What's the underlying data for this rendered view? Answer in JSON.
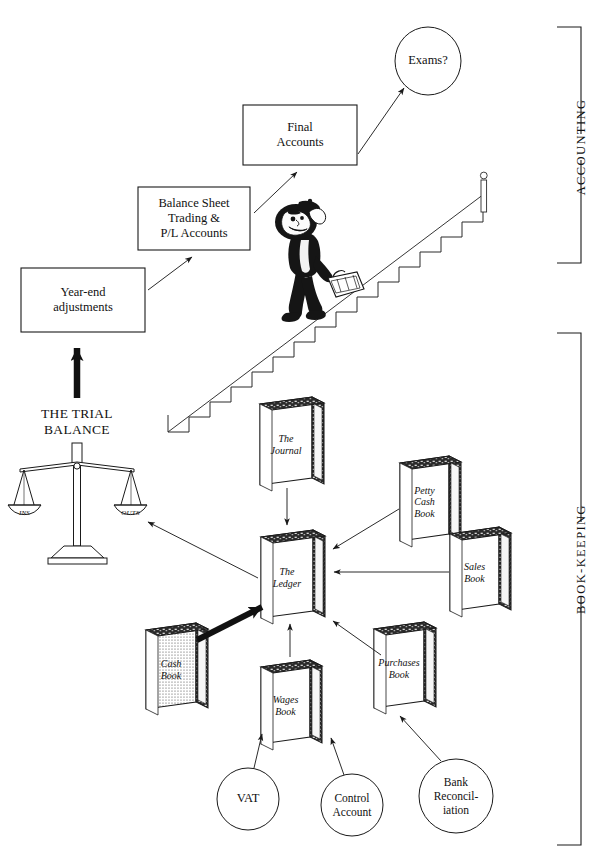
{
  "diagram": {
    "background": "#ffffff",
    "ink": "#1a1a1a"
  },
  "side_brackets": [
    {
      "id": "accounting",
      "label": "ACCOUNTING",
      "top": 27,
      "bottom": 263
    },
    {
      "id": "book-keeping",
      "label": "BOOK-KEEPING",
      "top": 333,
      "bottom": 845
    }
  ],
  "boxes": [
    {
      "id": "final-accounts",
      "label": "Final\nAccounts",
      "x": 243,
      "y": 105,
      "w": 114,
      "h": 60
    },
    {
      "id": "balance-sheet",
      "label": "Balance Sheet\nTrading &\nP/L Accounts",
      "x": 138,
      "y": 187,
      "w": 112,
      "h": 63
    },
    {
      "id": "year-end-adjustments",
      "label": "Year-end\nadjustments",
      "x": 21,
      "y": 268,
      "w": 124,
      "h": 64
    }
  ],
  "ellipses": [
    {
      "id": "exams",
      "label": "Exams?",
      "cx": 428,
      "cy": 61,
      "rx": 33,
      "ry": 34
    },
    {
      "id": "vat",
      "label": "VAT",
      "cx": 248,
      "cy": 799,
      "rx": 31,
      "ry": 31
    },
    {
      "id": "control-account",
      "label": "Control\nAccount",
      "cx": 352,
      "cy": 805,
      "rx": 31,
      "ry": 31
    },
    {
      "id": "bank-reconciliation",
      "label": "Bank\nReconcil-\niation",
      "cx": 456,
      "cy": 796,
      "rx": 37,
      "ry": 37
    }
  ],
  "books": [
    {
      "id": "the-journal",
      "label": "The\nJournal",
      "x": 260,
      "y": 397,
      "w": 60,
      "h": 88,
      "shaded": false
    },
    {
      "id": "the-ledger",
      "label": "The\nLedger",
      "x": 261,
      "y": 530,
      "w": 60,
      "h": 88,
      "shaded": false
    },
    {
      "id": "petty-cash-book",
      "label": "Petty\nCash\nBook",
      "x": 400,
      "y": 456,
      "w": 57,
      "h": 86,
      "shaded": false
    },
    {
      "id": "sales-book",
      "label": "Sales\nBook",
      "x": 450,
      "y": 527,
      "w": 57,
      "h": 84,
      "shaded": false
    },
    {
      "id": "cash-book",
      "label": "Cash\nBook",
      "x": 146,
      "y": 623,
      "w": 58,
      "h": 86,
      "shaded": true
    },
    {
      "id": "wages-book",
      "label": "Wages\nBook",
      "x": 261,
      "y": 660,
      "w": 57,
      "h": 84,
      "shaded": false
    },
    {
      "id": "purchases-book",
      "label": "Purchases\nBook",
      "x": 374,
      "y": 622,
      "w": 58,
      "h": 86,
      "shaded": false
    }
  ],
  "trial_balance": {
    "id": "the-trial-balance",
    "title": "THE TRIAL\nBALANCE",
    "title_x": 17,
    "title_y": 405,
    "left_pan_label": "INS",
    "right_pan_label": "OUTS",
    "scales_cx": 77,
    "scales_top": 443
  },
  "figure": {
    "id": "climbing-man"
  },
  "staircase": {
    "id": "staircase",
    "steps": 16,
    "x_start": 168,
    "y_start": 415,
    "x_end": 484,
    "y_end": 185,
    "post_label": "newel-post"
  },
  "arrows": [
    {
      "id": "arrow-final-to-exams",
      "from": "final-accounts",
      "to": "exams",
      "style": "thin"
    },
    {
      "id": "arrow-balance-to-final",
      "from": "balance-sheet",
      "to": "final-accounts",
      "style": "thin"
    },
    {
      "id": "arrow-yearend-to-balance",
      "from": "year-end-adjustments",
      "to": "balance-sheet",
      "style": "thin"
    },
    {
      "id": "arrow-trial-to-yearend",
      "from": "the-trial-balance",
      "to": "year-end-adjustments",
      "style": "thick"
    },
    {
      "id": "arrow-ledger-to-trial",
      "from": "the-ledger",
      "to": "the-trial-balance",
      "style": "thin"
    },
    {
      "id": "arrow-journal-to-ledger",
      "from": "the-journal",
      "to": "the-ledger",
      "style": "thin"
    },
    {
      "id": "arrow-petty-to-ledger",
      "from": "petty-cash-book",
      "to": "the-ledger",
      "style": "thin"
    },
    {
      "id": "arrow-sales-to-ledger",
      "from": "sales-book",
      "to": "the-ledger",
      "style": "thin"
    },
    {
      "id": "arrow-cash-to-ledger",
      "from": "cash-book",
      "to": "the-ledger",
      "style": "thick"
    },
    {
      "id": "arrow-wages-to-ledger",
      "from": "wages-book",
      "to": "the-ledger",
      "style": "thin"
    },
    {
      "id": "arrow-purchases-to-ledger",
      "from": "purchases-book",
      "to": "the-ledger",
      "style": "thin"
    },
    {
      "id": "arrow-vat-to-cashbook",
      "from": "vat",
      "to": "wages-book-area",
      "style": "thin"
    },
    {
      "id": "arrow-control-to-wages",
      "from": "control-account",
      "to": "wages-book",
      "style": "thin"
    },
    {
      "id": "arrow-bank-to-purchases",
      "from": "bank-reconciliation",
      "to": "purchases-book",
      "style": "thin"
    }
  ]
}
